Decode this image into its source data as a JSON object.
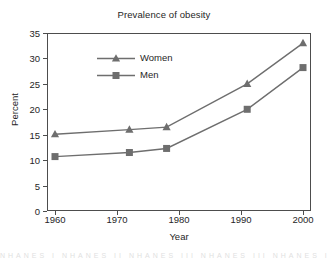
{
  "chart_data": {
    "type": "line",
    "title": "Prevalence of obesity",
    "xlabel": "Year",
    "ylabel": "Percent",
    "xlim": [
      1960,
      2000
    ],
    "ylim": [
      0,
      35
    ],
    "xticks": [
      1960,
      1970,
      1980,
      1990,
      2000
    ],
    "yticks": [
      0,
      5,
      10,
      15,
      20,
      25,
      30,
      35
    ],
    "grid": false,
    "legend_position": "upper-left-inside",
    "series": [
      {
        "name": "Women",
        "marker": "triangle",
        "color": "#6e6e6e",
        "x": [
          1960,
          1972,
          1978,
          1991,
          2000
        ],
        "values": [
          15.1,
          16.0,
          16.5,
          25.0,
          33.0
        ]
      },
      {
        "name": "Men",
        "marker": "square",
        "color": "#6e6e6e",
        "x": [
          1960,
          1972,
          1978,
          1991,
          2000
        ],
        "values": [
          10.7,
          11.5,
          12.3,
          20.0,
          28.2
        ]
      }
    ]
  },
  "colors": {
    "series": "#6e6e6e",
    "axis": "#4d4d4d",
    "text": "#262626",
    "background": "#ffffff"
  },
  "footer": {
    "clipped_text": "NHANES I   NHANES II   NHANES III   NHANES III   NHANES IV"
  }
}
